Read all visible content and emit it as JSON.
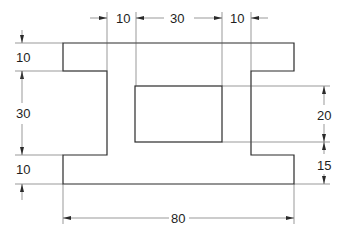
{
  "diagram": {
    "shape_color": "#2a2a2a",
    "dimension_color": "#555555",
    "dimensions": {
      "top": [
        {
          "label": "10",
          "description": "left web offset"
        },
        {
          "label": "30",
          "description": "inner rectangle width"
        },
        {
          "label": "10",
          "description": "right web offset"
        }
      ],
      "left": [
        {
          "label": "10",
          "description": "top flange height"
        },
        {
          "label": "30",
          "description": "web height"
        },
        {
          "label": "10",
          "description": "bottom flange height"
        }
      ],
      "right": [
        {
          "label": "20",
          "description": "inner rectangle height"
        },
        {
          "label": "15",
          "description": "rectangle to bottom"
        }
      ],
      "bottom": [
        {
          "label": "80",
          "description": "overall width"
        }
      ]
    }
  }
}
